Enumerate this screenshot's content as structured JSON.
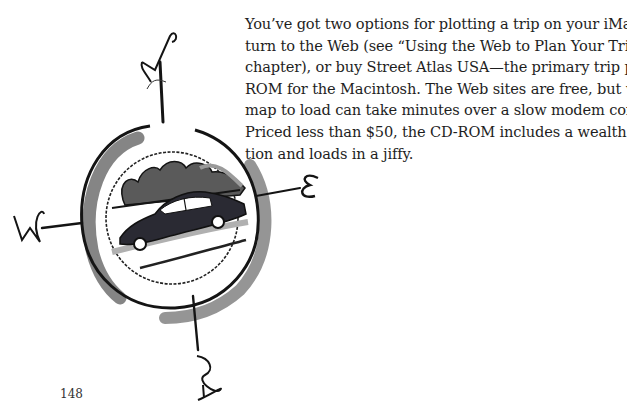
{
  "page": {
    "paragraph_lines": [
      "You’ve got two options for plotting a trip on your iMac. You can",
      "turn to the Web (see “Using the Web to Plan Your Trip” in this",
      "chapter), or buy Street Atlas USA—the primary trip planning CD-",
      "ROM for the Macintosh. The Web sites are free, but waiting for a",
      "map to load can take minutes over a slow modem connection.",
      "Priced less than $50, the CD-ROM includes a wealth of informa-",
      "tion and loads in a jiffy."
    ],
    "page_number": "148"
  },
  "illustration": {
    "subject": "compass-rose-with-car",
    "compass_letters": {
      "north": "N",
      "east": "E",
      "south": "S",
      "west": "W"
    },
    "colors": {
      "ink": "#141414",
      "wash": "#6e6e6e",
      "light_wash": "#a8a8a8",
      "car": "#2a2a33"
    }
  }
}
